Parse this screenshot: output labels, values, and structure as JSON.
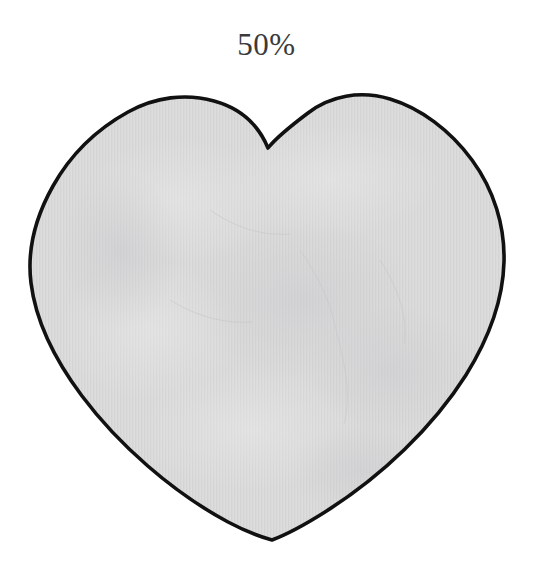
{
  "canvas": {
    "width": 533,
    "height": 588,
    "background_color": "#ffffff"
  },
  "label": {
    "text": "50%",
    "color": "#3a3a3a",
    "position": "top-center"
  },
  "figure": {
    "name": "heart",
    "fill_color": "#dcdcdc",
    "outline_color": "#111111",
    "outline_width": 3.4,
    "texture": "vertical-stripe-paper-grain",
    "fraction_shaded": "50%",
    "geometry": {
      "bottom_tip": [
        272,
        540
      ],
      "cleft_notch": [
        268,
        148
      ],
      "left_lobe_peak": [
        157,
        102
      ],
      "right_lobe_peak": [
        380,
        97
      ],
      "leftmost_x": 28,
      "rightmost_x": 503,
      "widest_y": 240
    }
  }
}
